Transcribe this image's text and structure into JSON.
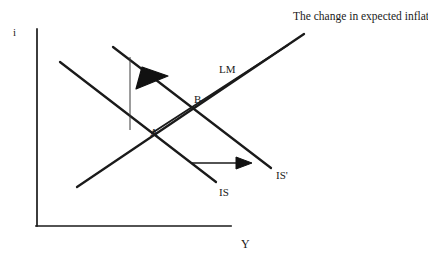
{
  "figure": {
    "kind": "is-lm-macro-diagram",
    "background_color": "#ffffff",
    "line_color": "#1a1a1a",
    "text_color": "#1a1a1a",
    "width": 428,
    "height": 261
  },
  "axes": {
    "vertical_label": "i",
    "horizontal_label": "Y",
    "origin": {
      "x": 37,
      "y": 226
    },
    "vertical_top": {
      "x": 37,
      "y": 29
    },
    "horizontal_right": {
      "x": 231,
      "y": 226
    }
  },
  "curves": {
    "is": {
      "label": "IS",
      "from": {
        "x": 60,
        "y": 62
      },
      "to": {
        "x": 216,
        "y": 182
      }
    },
    "is_prime": {
      "label": "IS'",
      "from": {
        "x": 113,
        "y": 47
      },
      "to": {
        "x": 271,
        "y": 168
      }
    },
    "lm": {
      "label": "LM",
      "from": {
        "x": 77,
        "y": 187
      },
      "to": {
        "x": 304,
        "y": 34
      }
    },
    "lm_shifted": {
      "label": "",
      "from": {
        "x": 152,
        "y": 133
      },
      "to": {
        "x": 288,
        "y": 45
      }
    }
  },
  "points": [
    {
      "label": "A",
      "x": 144,
      "y": 129
    },
    {
      "label": "B",
      "x": 188,
      "y": 100
    }
  ],
  "arrows": {
    "expected_inflation_arrow": {
      "from": {
        "x": 130,
        "y": 57
      },
      "to": {
        "x": 130,
        "y": 129
      },
      "head_at": {
        "x": 152,
        "y": 79
      },
      "direction": "up-left"
    },
    "is_shift_arrow": {
      "from": {
        "x": 191,
        "y": 163
      },
      "to": {
        "x": 251,
        "y": 163
      },
      "direction": "right"
    }
  },
  "annotations": {
    "expected_inflation_note": "The change in expected inflation."
  }
}
